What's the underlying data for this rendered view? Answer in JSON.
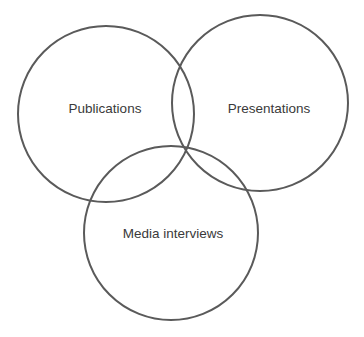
{
  "diagram": {
    "type": "venn",
    "sets": [
      {
        "label": "Publications",
        "cx": 106,
        "cy": 114,
        "r": 88,
        "label_x": 105,
        "label_y": 109
      },
      {
        "label": "Presentations",
        "cx": 260,
        "cy": 103,
        "r": 88,
        "label_x": 269,
        "label_y": 109
      },
      {
        "label": "Media interviews",
        "cx": 171,
        "cy": 233,
        "r": 87,
        "label_x": 173,
        "label_y": 234
      }
    ],
    "colors": {
      "stroke": "#5a5a5a",
      "text": "#3a3a3a",
      "background": "#ffffff"
    }
  }
}
